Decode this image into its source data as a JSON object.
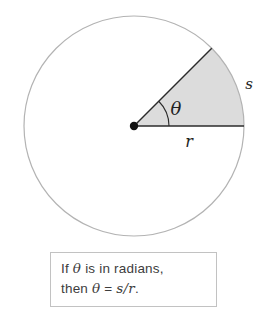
{
  "diagram": {
    "labels": {
      "angle": "θ",
      "radius": "r",
      "arc_length": "s"
    },
    "sector_angle_deg": 45,
    "colors": {
      "circle_outline": "#b3b3b3",
      "sector_fill": "#dcdcdc",
      "line": "#2b2b2b",
      "dot": "#121212"
    }
  },
  "caption": {
    "line1": [
      "If ",
      "θ",
      " is in radians,"
    ],
    "line2": [
      "then ",
      "θ",
      " = ",
      "s/r",
      "."
    ]
  }
}
